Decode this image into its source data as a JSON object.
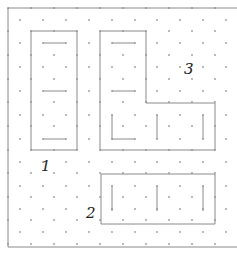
{
  "diagram": {
    "title": "",
    "colors": {
      "background": "#ffffff",
      "line": "#8a8a8a",
      "dot": "#9a9a9a",
      "label": "#222222"
    },
    "pieces": [
      {
        "id": "1",
        "label": "1",
        "label_pos": [
          41,
          171
        ]
      },
      {
        "id": "2",
        "label": "2",
        "label_pos": [
          86,
          218
        ]
      },
      {
        "id": "3",
        "label": "3",
        "label_pos": [
          184,
          74
        ]
      }
    ]
  }
}
